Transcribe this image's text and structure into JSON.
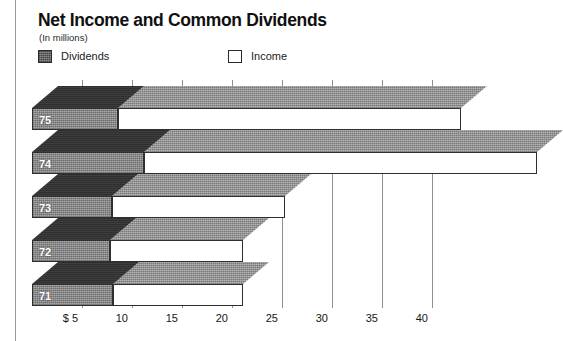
{
  "header": {
    "title": "Net Income and Common Dividends",
    "subtitle": "(In millions)"
  },
  "legend": {
    "position": "top-left",
    "items": [
      {
        "label": "Dividends",
        "swatch": "filled-gray-square",
        "color": "#8a8a8a"
      },
      {
        "label": "Income",
        "swatch": "hollow-white-square",
        "color": "#ffffff"
      }
    ]
  },
  "axis": {
    "ticks": [
      {
        "label": "$ 5",
        "value": 5
      },
      {
        "label": "10",
        "value": 10
      },
      {
        "label": "15",
        "value": 15
      },
      {
        "label": "20",
        "value": 20
      },
      {
        "label": "25",
        "value": 25
      },
      {
        "label": "30",
        "value": 30
      },
      {
        "label": "35",
        "value": 35
      },
      {
        "label": "40",
        "value": 40
      }
    ]
  },
  "chart_data": {
    "type": "bar",
    "orientation": "horizontal",
    "stacked": true,
    "style": "3d-isometric",
    "title": "Net Income and Common Dividends",
    "subtitle": "(In millions)",
    "xlabel": "",
    "ylabel": "",
    "xlim": [
      0,
      41
    ],
    "grid": true,
    "categories": [
      "75",
      "74",
      "73",
      "72",
      "71"
    ],
    "series": [
      {
        "name": "Dividends",
        "color": "#8a8a8a",
        "values": [
          8.6,
          11.2,
          8.0,
          7.8,
          8.1
        ]
      },
      {
        "name": "Income",
        "color": "#ffffff",
        "values": [
          34.3,
          39.3,
          17.3,
          13.3,
          13.0
        ]
      }
    ],
    "bars": [
      {
        "year": "75",
        "dividends": 8.6,
        "income": 34.3
      },
      {
        "year": "74",
        "dividends": 11.2,
        "income": 39.3
      },
      {
        "year": "73",
        "dividends": 8.0,
        "income": 17.3
      },
      {
        "year": "72",
        "dividends": 7.8,
        "income": 13.3
      },
      {
        "year": "71",
        "dividends": 8.1,
        "income": 13.0
      }
    ]
  }
}
